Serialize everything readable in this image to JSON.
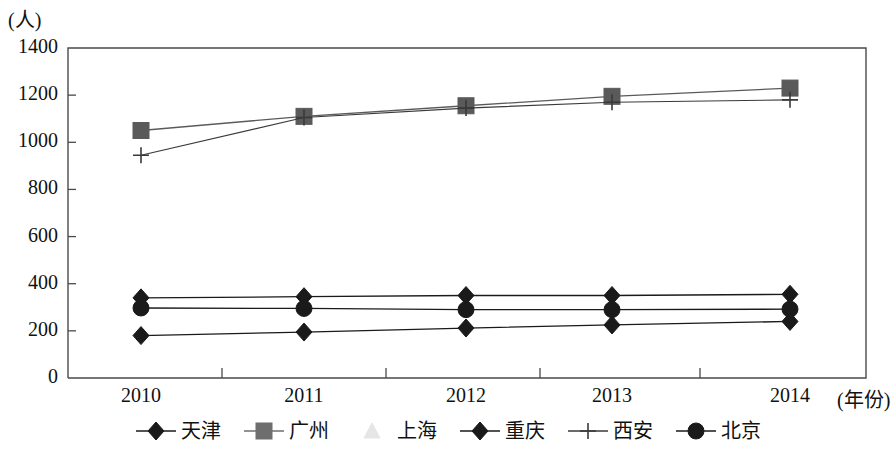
{
  "chart_data": {
    "type": "line",
    "title": "",
    "xlabel": "(年份)",
    "ylabel": "(人)",
    "categories": [
      "2010",
      "2011",
      "2012",
      "2013",
      "2014"
    ],
    "x": [
      2010,
      2011,
      2012,
      2013,
      2014
    ],
    "ylim": [
      0,
      1400
    ],
    "yticks": [
      0,
      200,
      400,
      600,
      800,
      1000,
      1200,
      1400
    ],
    "ytick_labels": [
      "0",
      "200",
      "400",
      "600",
      "800",
      "1000",
      "1200",
      "1400"
    ],
    "grid": false,
    "legend_position": "bottom",
    "series": [
      {
        "name": "天津",
        "marker": "diamond",
        "color": "#1a1a1a",
        "values": [
          340,
          345,
          350,
          350,
          355
        ]
      },
      {
        "name": "广州",
        "marker": "square",
        "color": "#5a5a5a",
        "values": [
          1050,
          1110,
          1155,
          1195,
          1230
        ]
      },
      {
        "name": "上海",
        "marker": "triangle",
        "color": "#e2e2e2",
        "values": [
          null,
          null,
          null,
          null,
          null
        ]
      },
      {
        "name": "重庆",
        "marker": "diamond",
        "color": "#1a1a1a",
        "values": [
          180,
          195,
          212,
          225,
          240
        ]
      },
      {
        "name": "西安",
        "marker": "plus",
        "color": "#3a3a3a",
        "values": [
          945,
          1105,
          1145,
          1170,
          1180
        ]
      },
      {
        "name": "北京",
        "marker": "circle",
        "color": "#1a1a1a",
        "values": [
          297,
          295,
          290,
          290,
          292
        ]
      }
    ]
  },
  "axis": {
    "y_unit_label": "(人)",
    "x_unit_label": "(年份)"
  },
  "legend": {
    "items": [
      {
        "label": "天津",
        "marker": "diamond",
        "color": "#1a1a1a",
        "show_line": true
      },
      {
        "label": "广州",
        "marker": "square",
        "color": "#6e6e6e",
        "show_line": true
      },
      {
        "label": "上海",
        "marker": "triangle",
        "color": "#e6e6e6",
        "show_line": false
      },
      {
        "label": "重庆",
        "marker": "diamond",
        "color": "#1a1a1a",
        "show_line": true
      },
      {
        "label": "西安",
        "marker": "plus",
        "color": "#3a3a3a",
        "show_line": true
      },
      {
        "label": "北京",
        "marker": "circle",
        "color": "#1a1a1a",
        "show_line": true
      }
    ]
  }
}
